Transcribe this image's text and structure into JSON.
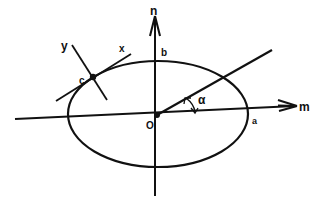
{
  "diagram": {
    "colors": {
      "ink": "#111111",
      "background": "#ffffff"
    },
    "labels": {
      "n_axis": "n",
      "m_axis": "m",
      "origin": "O",
      "semi_major": "a",
      "semi_minor": "b",
      "angle": "α",
      "point": "c",
      "x_axis": "x",
      "y_axis": "y"
    },
    "ellipse": {
      "cx": 158,
      "cy": 114,
      "rx": 90,
      "ry": 53
    },
    "origin_point": {
      "x": 157,
      "y": 115
    },
    "tangent_point": {
      "x": 93,
      "y": 77
    }
  }
}
